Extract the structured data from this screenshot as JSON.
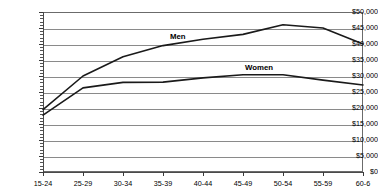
{
  "chart_data": {
    "type": "line",
    "title": "",
    "subtitle": "",
    "xlabel": "",
    "ylabel": "",
    "categories": [
      "15-24",
      "25-29",
      "30-34",
      "35-39",
      "40-44",
      "45-49",
      "50-54",
      "55-59",
      "60-6"
    ],
    "ylim": [
      0,
      50000
    ],
    "ytick_step": 5000,
    "ytick_labels": [
      "$0",
      "$5,000",
      "$10,000",
      "$15,000",
      "$20,000",
      "$25,000",
      "$30,000",
      "$35,000",
      "$40,000",
      "$45,000",
      "$50,000"
    ],
    "grid": true,
    "legend_position": "inline-annotation",
    "series": [
      {
        "name": "Men",
        "color": "#1a1a1a",
        "values": [
          19500,
          30000,
          36000,
          39500,
          41500,
          43000,
          46000,
          45000,
          40000
        ]
      },
      {
        "name": "Women",
        "color": "#1a1a1a",
        "values": [
          17800,
          26300,
          28000,
          28100,
          29400,
          30400,
          30400,
          28700,
          27200
        ]
      }
    ],
    "annotations": [
      {
        "text": "Men",
        "series": "Men"
      },
      {
        "text": "Women",
        "series": "Women"
      }
    ]
  },
  "axis": {
    "y_labels": [
      "$50,000",
      "$45,000",
      "$40,000",
      "$35,000",
      "$30,000",
      "$25,000",
      "$20,000",
      "$15,000",
      "$10,000",
      "$5,000",
      "$0"
    ],
    "x_labels": [
      "15-24",
      "25-29",
      "30-34",
      "35-39",
      "40-44",
      "45-49",
      "50-54",
      "55-59",
      "60-6"
    ]
  },
  "labels": {
    "men": "Men",
    "women": "Women"
  },
  "colors": {
    "line": "#1a1a1a",
    "grid": "#8a8a8a",
    "frame": "#6b6b6b",
    "text": "#000000",
    "background": "#ffffff"
  }
}
